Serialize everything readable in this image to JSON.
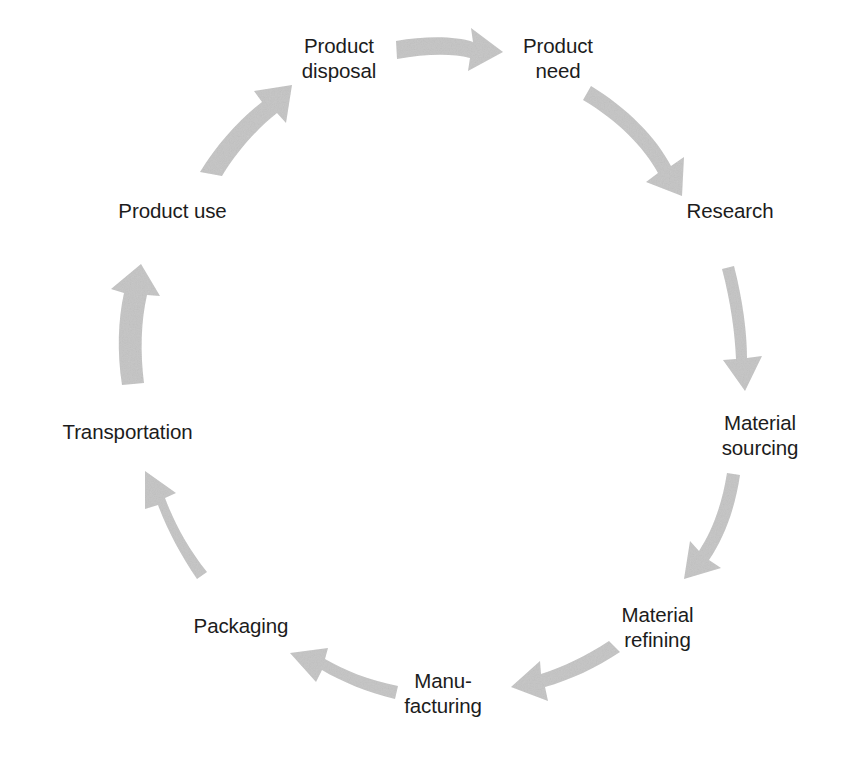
{
  "diagram": {
    "type": "cycle",
    "direction": "clockwise",
    "background_color": "#ffffff",
    "arrow_color": "#c3c3c3",
    "text_color": "#1c1c1c",
    "nodes": [
      {
        "id": "product-disposal",
        "label": "Product\ndisposal",
        "align": "center"
      },
      {
        "id": "product-need",
        "label": "Product\nneed",
        "align": "center"
      },
      {
        "id": "research",
        "label": "Research",
        "align": "center"
      },
      {
        "id": "material-sourcing",
        "label": "Material\nsourcing",
        "align": "center"
      },
      {
        "id": "material-refining",
        "label": "Material\nrefining",
        "align": "center"
      },
      {
        "id": "manufacturing",
        "label": "Manu-\nfacturing",
        "align": "center"
      },
      {
        "id": "packaging",
        "label": "Packaging",
        "align": "center"
      },
      {
        "id": "transportation",
        "label": "Transportation",
        "align": "center"
      },
      {
        "id": "product-use",
        "label": "Product use",
        "align": "center"
      }
    ],
    "edges": [
      {
        "id": "arrow-disposal-to-need",
        "from": "product-disposal",
        "to": "product-need"
      },
      {
        "id": "arrow-need-to-research",
        "from": "product-need",
        "to": "research"
      },
      {
        "id": "arrow-research-to-sourcing",
        "from": "research",
        "to": "material-sourcing"
      },
      {
        "id": "arrow-sourcing-to-refining",
        "from": "material-sourcing",
        "to": "material-refining"
      },
      {
        "id": "arrow-refining-to-manufacturing",
        "from": "material-refining",
        "to": "manufacturing"
      },
      {
        "id": "arrow-manufacturing-to-packaging",
        "from": "manufacturing",
        "to": "packaging"
      },
      {
        "id": "arrow-packaging-to-transportation",
        "from": "packaging",
        "to": "transportation"
      },
      {
        "id": "arrow-transportation-to-use",
        "from": "transportation",
        "to": "product-use"
      },
      {
        "id": "arrow-use-to-disposal",
        "from": "product-use",
        "to": "product-disposal"
      }
    ]
  },
  "labels": {
    "product_disposal": "Product\ndisposal",
    "product_need": "Product\nneed",
    "research": "Research",
    "material_sourcing": "Material\nsourcing",
    "material_refining": "Material\nrefining",
    "manufacturing": "Manu-\nfacturing",
    "packaging": "Packaging",
    "transportation": "Transportation",
    "product_use": "Product use"
  }
}
